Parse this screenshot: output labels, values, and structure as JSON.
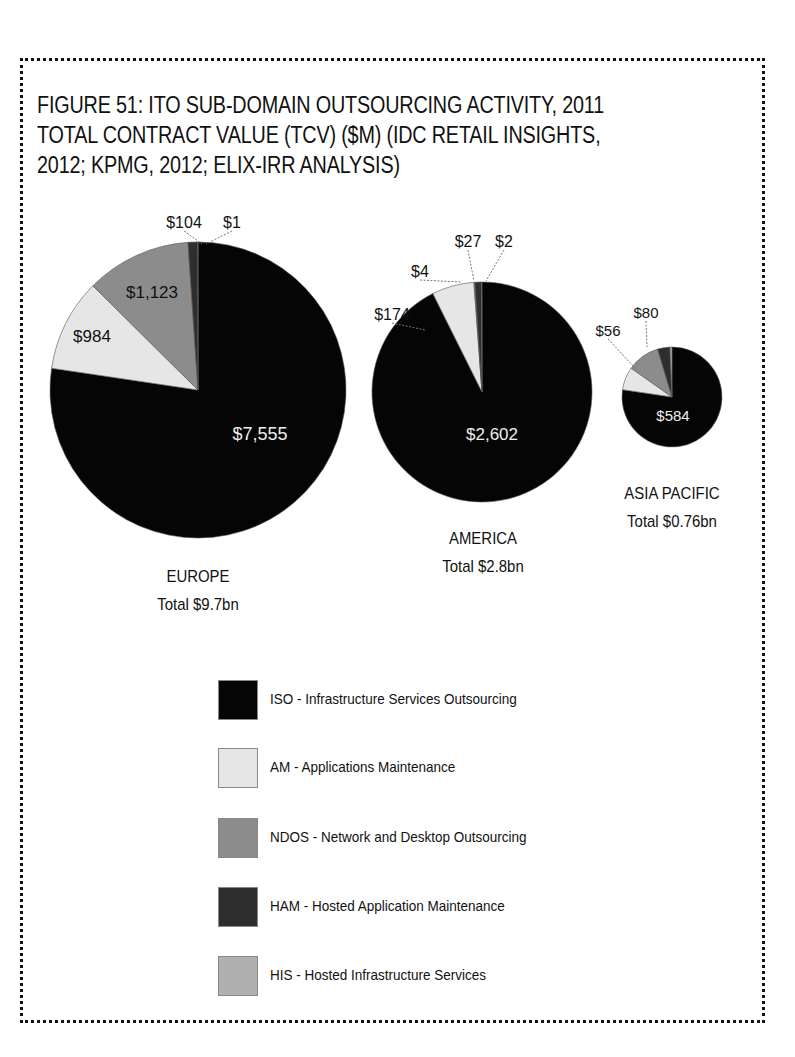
{
  "figure": {
    "title": "FIGURE 51: ITO SUB-DOMAIN OUTSOURCING ACTIVITY, 2011 TOTAL CONTRACT VALUE (TCV) ($M) (IDC RETAIL INSIGHTS, 2012; KPMG, 2012; ELIX-IRR ANALYSIS)"
  },
  "colors": {
    "ISO": "#050505",
    "AM": "#e6e6e6",
    "NDOS": "#8c8c8c",
    "HAM": "#2e2e2e",
    "HIS": "#b0b0b0"
  },
  "legend": [
    {
      "key": "ISO",
      "label": "ISO - Infrastructure Services Outsourcing"
    },
    {
      "key": "AM",
      "label": "AM - Applications Maintenance"
    },
    {
      "key": "NDOS",
      "label": "NDOS - Network and Desktop Outsourcing"
    },
    {
      "key": "HAM",
      "label": "HAM - Hosted Application Maintenance"
    },
    {
      "key": "HIS",
      "label": "HIS - Hosted Infrastructure Services"
    }
  ],
  "regions": [
    {
      "name": "EUROPE",
      "total": "Total $9.7bn"
    },
    {
      "name": "AMERICA",
      "total": "Total $2.8bn"
    },
    {
      "name": "ASIA PACIFIC",
      "total": "Total $0.76bn"
    }
  ],
  "chart_data": {
    "type": "pie",
    "title": "FIGURE 51: ITO SUB-DOMAIN OUTSOURCING ACTIVITY, 2011 TOTAL CONTRACT VALUE (TCV) ($M)",
    "unit": "$M",
    "categories": [
      "ISO",
      "AM",
      "NDOS",
      "HAM",
      "HIS"
    ],
    "legend_labels": [
      "ISO - Infrastructure Services Outsourcing",
      "AM - Applications Maintenance",
      "NDOS - Network and Desktop Outsourcing",
      "HAM - Hosted Application Maintenance",
      "HIS - Hosted Infrastructure Services"
    ],
    "legend_position": "bottom",
    "pies": [
      {
        "name": "EUROPE",
        "total_label": "Total $9.7bn",
        "values": [
          7555,
          984,
          1123,
          104,
          1
        ],
        "labels": [
          "$7,555",
          "$984",
          "$1,123",
          "$104",
          "$1"
        ]
      },
      {
        "name": "AMERICA",
        "total_label": "Total $2.8bn",
        "values": [
          2602,
          174,
          4,
          27,
          2
        ],
        "labels": [
          "$2,602",
          "$174",
          "$4",
          "$27",
          "$2"
        ]
      },
      {
        "name": "ASIA PACIFIC",
        "total_label": "Total $0.76bn",
        "values": [
          584,
          56,
          80,
          30,
          5
        ],
        "labels": [
          "$584",
          "$56",
          "$80",
          "",
          ""
        ]
      }
    ]
  }
}
